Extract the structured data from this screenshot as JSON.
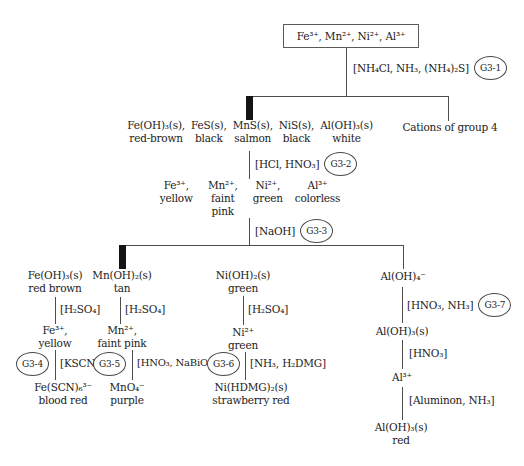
{
  "figure": {
    "root": "Fe³⁺, Mn²⁺, Ni²⁺, Al³⁺",
    "group4": "Cations of group 4"
  },
  "steps": {
    "g1": {
      "reagent": "[NH₄Cl, NH₃, (NH₄)₂S]",
      "tag": "G3-1"
    },
    "g2": {
      "reagent": "[HCl, HNO₃]",
      "tag": "G3-2"
    },
    "g3": {
      "reagent": "[NaOH]",
      "tag": "G3-3"
    },
    "g4": {
      "reagent": "[KSCN]",
      "tag": "G3-4"
    },
    "g5": {
      "reagent": "[HNO₃, NaBiO₃]",
      "tag": "G3-5"
    },
    "g6": {
      "reagent": "[NH₃, H₂DMG]",
      "tag": "G3-6"
    },
    "g7": {
      "reagent": "[HNO₃, NH₃]",
      "tag": "G3-7"
    }
  },
  "precipitate": {
    "items": [
      {
        "formula": "Fe(OH)₃(s),",
        "color": "red-brown"
      },
      {
        "formula": "FeS(s),",
        "color": "black"
      },
      {
        "formula": "MnS(s),",
        "color": "salmon"
      },
      {
        "formula": "NiS(s),",
        "color": "black"
      },
      {
        "formula": "Al(OH)₃(s)",
        "color": "white"
      }
    ]
  },
  "ions": {
    "items": [
      {
        "ion": "Fe³⁺,",
        "color": "yellow"
      },
      {
        "ion": "Mn²⁺,",
        "color": "faint pink"
      },
      {
        "ion": "Ni²⁺,",
        "color": "green"
      },
      {
        "ion": "Al³⁺",
        "color": "colorless"
      }
    ]
  },
  "fe": {
    "hydroxide": "Fe(OH)₃(s)",
    "hydroxide_color": "red brown",
    "reagent": "[H₂SO₄]",
    "ion": "Fe³⁺,",
    "ion_color": "yellow",
    "product": "Fe(SCN)₆³⁻",
    "product_color": "blood red"
  },
  "mn": {
    "hydroxide": "Mn(OH)₂(s)",
    "hydroxide_color": "tan",
    "reagent": "[H₂SO₄]",
    "ion": "Mn²⁺,",
    "ion_color": "faint pink",
    "product": "MnO₄⁻",
    "product_color": "purple"
  },
  "ni": {
    "hydroxide": "Ni(OH)₂(s)",
    "hydroxide_color": "green",
    "reagent": "[H₂SO₄]",
    "ion": "Ni²⁺",
    "ion_color": "green",
    "product": "Ni(HDMG)₂(s)",
    "product_color": "strawberry red"
  },
  "al": {
    "complex": "Al(OH)₄⁻",
    "hydroxide": "Al(OH)₃(s)",
    "reagent_hno3": "[HNO₃]",
    "ion": "Al³⁺",
    "reagent_aluminon": "[Aluminon, NH₃]",
    "final": "Al(OH)₃(s)",
    "final_color": "red"
  }
}
